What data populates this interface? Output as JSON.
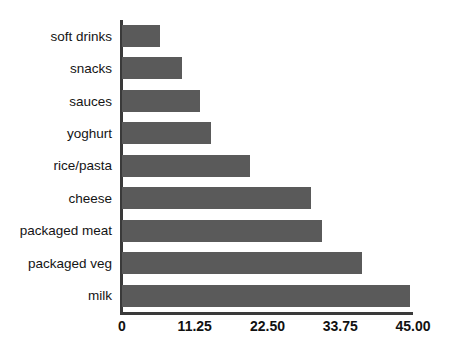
{
  "chart_data": {
    "type": "bar",
    "orientation": "horizontal",
    "title": "",
    "xlabel": "",
    "ylabel": "",
    "xlim": [
      0,
      45
    ],
    "grid": false,
    "legend": false,
    "bar_color": "#5a5a5a",
    "axis_color": "#3a3a3a",
    "background": "#ffffff",
    "xticks": [
      "0",
      "11.25",
      "22.50",
      "33.75",
      "45.00"
    ],
    "xtick_values": [
      0,
      11.25,
      22.5,
      33.75,
      45
    ],
    "categories": [
      "soft drinks",
      "snacks",
      "sauces",
      "yoghurt",
      "rice/pasta",
      "cheese",
      "packaged meat",
      "packaged veg",
      "milk"
    ],
    "values": [
      5.9,
      9.3,
      12.1,
      13.8,
      19.8,
      29.2,
      30.9,
      37.1,
      44.5
    ]
  }
}
